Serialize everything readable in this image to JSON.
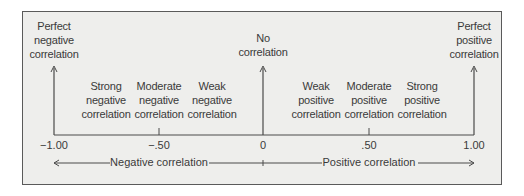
{
  "diagram": {
    "endpoints": {
      "negative": [
        "Perfect",
        "negative",
        "correlation"
      ],
      "zero": [
        "No",
        "correlation"
      ],
      "positive": [
        "Perfect",
        "positive",
        "correlation"
      ]
    },
    "strengths": [
      {
        "id": "strong-negative",
        "lines": [
          "Strong",
          "negative",
          "correlation"
        ]
      },
      {
        "id": "moderate-negative",
        "lines": [
          "Moderate",
          "negative",
          "correlation"
        ]
      },
      {
        "id": "weak-negative",
        "lines": [
          "Weak",
          "negative",
          "correlation"
        ]
      },
      {
        "id": "weak-positive",
        "lines": [
          "Weak",
          "positive",
          "correlation"
        ]
      },
      {
        "id": "moderate-positive",
        "lines": [
          "Moderate",
          "positive",
          "correlation"
        ]
      },
      {
        "id": "strong-positive",
        "lines": [
          "Strong",
          "positive",
          "correlation"
        ]
      }
    ],
    "ticks": [
      "−1.00",
      "−.50",
      "0",
      ".50",
      "1.00"
    ],
    "direction_labels": {
      "negative": "Negative correlation",
      "positive": "Positive correlation"
    },
    "colors": {
      "background": "#eeeeec",
      "line": "#4a4a4a",
      "text": "#3a3a3a"
    }
  }
}
